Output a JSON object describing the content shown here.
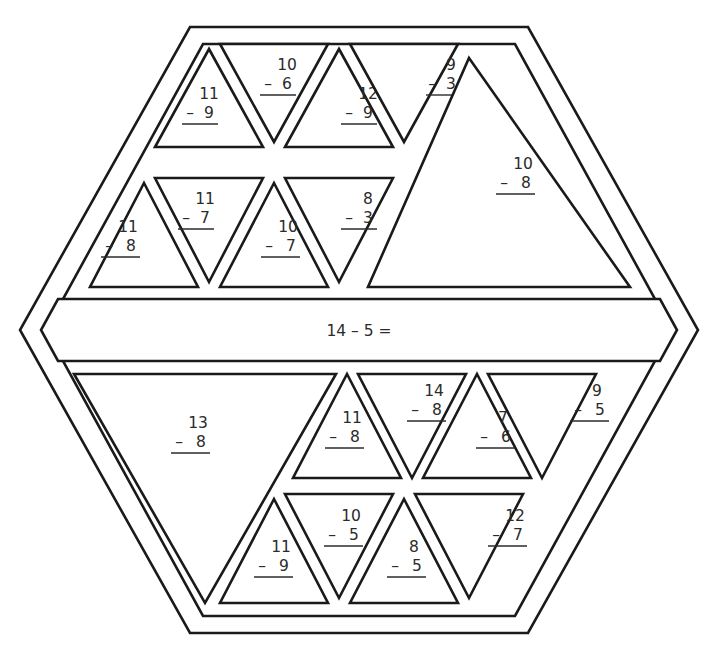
{
  "worksheet": {
    "type": "color-by-number-subtraction-hexagon",
    "shape": "hexagon",
    "band": {
      "label": "14 – 5 ="
    },
    "tiles": [
      {
        "id": "t1",
        "minuend": "11",
        "subtrahend": "9",
        "operator": "–",
        "orientation": "up",
        "size": "small",
        "region": "top-row-1",
        "col": 1
      },
      {
        "id": "t2",
        "minuend": "10",
        "subtrahend": "6",
        "operator": "–",
        "orientation": "down",
        "size": "small",
        "region": "top-row-1",
        "col": 2
      },
      {
        "id": "t3",
        "minuend": "12",
        "subtrahend": "9",
        "operator": "–",
        "orientation": "up",
        "size": "small",
        "region": "top-row-1",
        "col": 3
      },
      {
        "id": "t4",
        "minuend": "9",
        "subtrahend": "3",
        "operator": "–",
        "orientation": "down",
        "size": "small",
        "region": "top-row-1",
        "col": 4
      },
      {
        "id": "t5",
        "minuend": "11",
        "subtrahend": "8",
        "operator": "–",
        "orientation": "up",
        "size": "small",
        "region": "top-row-2",
        "col": 1
      },
      {
        "id": "t6",
        "minuend": "11",
        "subtrahend": "7",
        "operator": "–",
        "orientation": "down",
        "size": "small",
        "region": "top-row-2",
        "col": 2
      },
      {
        "id": "t7",
        "minuend": "10",
        "subtrahend": "7",
        "operator": "–",
        "orientation": "up",
        "size": "small",
        "region": "top-row-2",
        "col": 3
      },
      {
        "id": "t8",
        "minuend": "8",
        "subtrahend": "3",
        "operator": "–",
        "orientation": "down",
        "size": "small",
        "region": "top-row-2",
        "col": 4
      },
      {
        "id": "t9",
        "minuend": "10",
        "subtrahend": "8",
        "operator": "–",
        "orientation": "up",
        "size": "large",
        "region": "top-right-big",
        "col": 5
      },
      {
        "id": "t10",
        "minuend": "13",
        "subtrahend": "8",
        "operator": "–",
        "orientation": "down",
        "size": "large",
        "region": "bottom-left-big",
        "col": 1
      },
      {
        "id": "t11",
        "minuend": "11",
        "subtrahend": "8",
        "operator": "–",
        "orientation": "up",
        "size": "small",
        "region": "bottom-row-1",
        "col": 3
      },
      {
        "id": "t12",
        "minuend": "14",
        "subtrahend": "8",
        "operator": "–",
        "orientation": "down",
        "size": "small",
        "region": "bottom-row-1",
        "col": 4
      },
      {
        "id": "t13",
        "minuend": "7",
        "subtrahend": "6",
        "operator": "–",
        "orientation": "up",
        "size": "small",
        "region": "bottom-row-1",
        "col": 5
      },
      {
        "id": "t14",
        "minuend": "9",
        "subtrahend": "5",
        "operator": "–",
        "orientation": "down",
        "size": "small",
        "region": "bottom-row-1",
        "col": 6
      },
      {
        "id": "t15",
        "minuend": "11",
        "subtrahend": "9",
        "operator": "–",
        "orientation": "up",
        "size": "small",
        "region": "bottom-row-2",
        "col": 2
      },
      {
        "id": "t16",
        "minuend": "10",
        "subtrahend": "5",
        "operator": "–",
        "orientation": "down",
        "size": "small",
        "region": "bottom-row-2",
        "col": 3
      },
      {
        "id": "t17",
        "minuend": "8",
        "subtrahend": "5",
        "operator": "–",
        "orientation": "up",
        "size": "small",
        "region": "bottom-row-2",
        "col": 4
      },
      {
        "id": "t18",
        "minuend": "12",
        "subtrahend": "7",
        "operator": "–",
        "orientation": "down",
        "size": "small",
        "region": "bottom-row-2",
        "col": 5
      }
    ],
    "colors": {
      "ink": "#1a1a1a",
      "text": "#2b2b2b",
      "paper": "#ffffff"
    }
  }
}
